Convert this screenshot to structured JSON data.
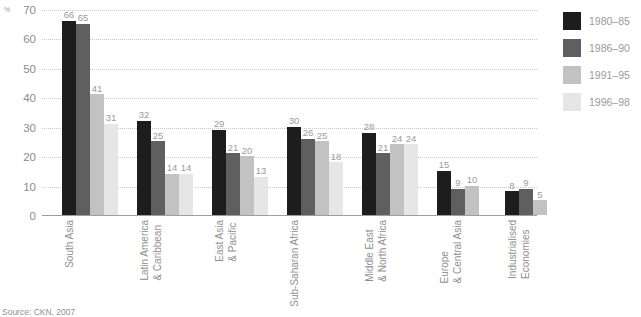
{
  "chart_data": {
    "type": "bar",
    "title": "",
    "subtitle": "",
    "xlabel": "",
    "ylabel": "%",
    "ylim": [
      0,
      70
    ],
    "yticks": [
      0,
      10,
      20,
      30,
      40,
      50,
      60,
      70
    ],
    "ytick_labels": [
      "0",
      "10",
      "20",
      "30",
      "40",
      "50",
      "60",
      "70"
    ],
    "grid": true,
    "legend_position": "right",
    "categories": [
      "South Asia",
      "Latin America & Caribbean",
      "East Asia & Pacific",
      "Sub-Saharan Africa",
      "Middle East & North Africa",
      "Europe & Central Asia",
      "Industrialised Economies"
    ],
    "category_lines": [
      [
        "South Asia"
      ],
      [
        "Latin America",
        "& Caribbean"
      ],
      [
        "East Asia",
        "& Pacific"
      ],
      [
        "Sub-Saharan Africa"
      ],
      [
        "Middle East",
        "& North Africa"
      ],
      [
        "Europe",
        "& Central Asia"
      ],
      [
        "Industrialised",
        "Economies"
      ]
    ],
    "series": [
      {
        "name": "1980–85",
        "color": "#1d1d1d",
        "values": [
          66,
          32,
          29,
          30,
          28,
          15,
          8
        ]
      },
      {
        "name": "1986–90",
        "color": "#5f5f5f",
        "values": [
          65,
          25,
          21,
          26,
          21,
          9,
          9
        ]
      },
      {
        "name": "1991–95",
        "color": "#c2c2c2",
        "values": [
          41,
          14,
          20,
          25,
          24,
          10,
          5
        ]
      },
      {
        "name": "1996–98",
        "color": "#e6e6e6",
        "values": [
          31,
          14,
          13,
          18,
          24,
          null,
          null
        ]
      }
    ]
  },
  "source": {
    "text": "Source: CKN, 2007"
  },
  "colors": {
    "grid": "#c9c9c9",
    "axis": "#9e9e9e",
    "text": "#8f8f8f",
    "background": "#ffffff"
  }
}
